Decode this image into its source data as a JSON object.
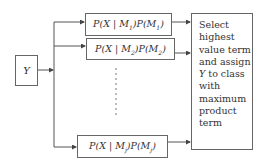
{
  "diagram": {
    "input": {
      "label": "Y"
    },
    "terms": [
      {
        "prefix": "P(X | M",
        "sub1": "1",
        "mid": ")P(M",
        "sub2": "1",
        "suffix": ")"
      },
      {
        "prefix": "P(X | M",
        "sub1": "2",
        "mid": ")P(M",
        "sub2": "2",
        "suffix": ")"
      },
      {
        "prefix": "P(X | M",
        "sub1": "j",
        "mid": ")P(M",
        "sub2": "j",
        "suffix": ")"
      }
    ],
    "decision": {
      "lines": [
        "Select",
        "highest",
        "value term",
        "and assign",
        "to class",
        "with",
        "maximum",
        "product",
        "term"
      ],
      "y_var": "Y"
    },
    "colors": {
      "line": "#555555",
      "border": "#666666"
    }
  }
}
